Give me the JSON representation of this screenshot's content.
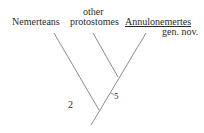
{
  "diagram": {
    "type": "cladogram",
    "taxa": [
      {
        "label": "Nemerteans"
      },
      {
        "label_line1": "other",
        "label_line2": "protostomes"
      },
      {
        "label": "Annulonemertes",
        "sublabel": "gen. nov.",
        "underlined": true
      }
    ],
    "node_labels": {
      "outer_node": "2",
      "inner_node": "5"
    },
    "line_color": "#6e6e6e",
    "text_color": "#2a2a2a"
  }
}
